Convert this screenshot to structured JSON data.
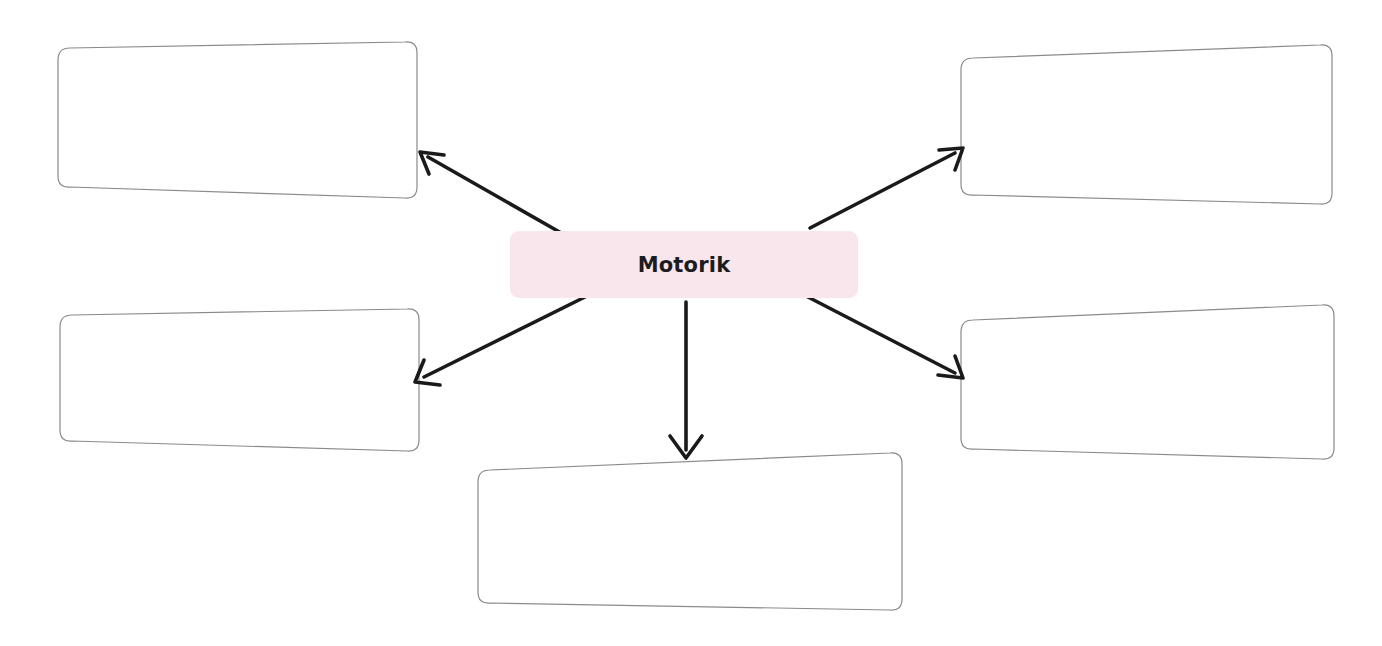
{
  "document": {
    "type": "concept-map-worksheet",
    "language": "de",
    "background_color": "#ffffff"
  },
  "center": {
    "label": "Motorik",
    "fill_color": "#f9e6ec",
    "text_color": "#1c1c1c"
  },
  "style": {
    "box_border_color": "#808080",
    "arrow_color": "#1a1a1a"
  },
  "boxes": [
    {
      "id": "top-left",
      "label": "",
      "position": "top-left"
    },
    {
      "id": "top-right",
      "label": "",
      "position": "top-right"
    },
    {
      "id": "bottom-left",
      "label": "",
      "position": "bottom-left"
    },
    {
      "id": "bottom-right",
      "label": "",
      "position": "bottom-right"
    },
    {
      "id": "bottom-center",
      "label": "",
      "position": "bottom-center"
    }
  ],
  "arrows": [
    {
      "id": "arrow-to-top-left",
      "from": "center",
      "to": "top-left",
      "direction": "up-left"
    },
    {
      "id": "arrow-to-top-right",
      "from": "center",
      "to": "top-right",
      "direction": "up-right"
    },
    {
      "id": "arrow-to-bottom-left",
      "from": "center",
      "to": "bottom-left",
      "direction": "down-left"
    },
    {
      "id": "arrow-to-bottom-right",
      "from": "center",
      "to": "bottom-right",
      "direction": "down-right"
    },
    {
      "id": "arrow-to-bottom-center",
      "from": "center",
      "to": "bottom-center",
      "direction": "down"
    }
  ]
}
